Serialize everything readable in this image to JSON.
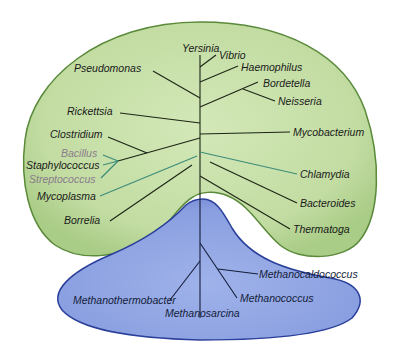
{
  "diagram": {
    "title": "",
    "domains": [
      {
        "name": "Bacteria",
        "fill": "#c5dea6",
        "edge": "#5a8a3a",
        "shape": "green-kidney",
        "taxa": [
          "Yersinia",
          "Vibrio",
          "Haemophilus",
          "Bordetella",
          "Neisseria",
          "Pseudomonas",
          "Rickettsia",
          "Mycobacterium",
          "Clostridium",
          "Bacillus",
          "Staphylococcus",
          "Streptococcus",
          "Chlamydia",
          "Mycoplasma",
          "Bacteroides",
          "Borrelia",
          "Thermatoga"
        ]
      },
      {
        "name": "Archaea",
        "fill": "#8ea4e0",
        "edge": "#2a3f9a",
        "shape": "blue-triangle",
        "taxa": [
          "Methanocaldococcus",
          "Methanothermobacter",
          "Methanococcus",
          "Methanosarcina"
        ]
      }
    ],
    "labels": {
      "yersinia": "Yersinia",
      "vibrio": "Vibrio",
      "haemophilus": "Haemophilus",
      "bordetella": "Bordetella",
      "neisseria": "Neisseria",
      "pseudomonas": "Pseudomonas",
      "rickettsia": "Rickettsia",
      "mycobacterium": "Mycobacterium",
      "clostridium": "Clostridium",
      "bacillus": "Bacillus",
      "staphylococcus": "Staphylococcus",
      "streptococcus": "Streptococcus",
      "chlamydia": "Chlamydia",
      "mycoplasma": "Mycoplasma",
      "bacteroides": "Bacteroides",
      "borrelia": "Borrelia",
      "thermatoga": "Thermatoga",
      "methanocaldococcus": "Methanocaldococcus",
      "methanothermobacter": "Methanothermobacter",
      "methanococcus": "Methanococcus",
      "methanosarcina": "Methanosarcina"
    },
    "colors": {
      "bacteria_fill": "#c5dea6",
      "bacteria_edge": "#5a8a3a",
      "archaea_fill": "#8ea4e0",
      "archaea_edge": "#2a3f9a",
      "branch": "#1c2415",
      "faded_label": "#8a7b8c"
    }
  }
}
